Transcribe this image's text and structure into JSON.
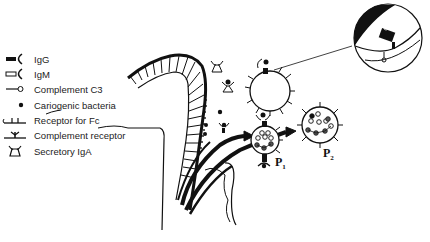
{
  "legend": {
    "items": [
      {
        "icon": "igg-icon",
        "label": "IgG"
      },
      {
        "icon": "igm-icon",
        "label": "IgM"
      },
      {
        "icon": "complement-c3-icon",
        "label": "Complement C3"
      },
      {
        "icon": "bacteria-dot-icon",
        "label": "Cariogenic bacteria"
      },
      {
        "icon": "fc-receptor-icon",
        "label": "Receptor for Fc"
      },
      {
        "icon": "complement-receptor-icon",
        "label": "Complement receptor"
      },
      {
        "icon": "secretory-iga-icon",
        "label": "Secretory IgA"
      }
    ]
  },
  "labels": {
    "p1": "P",
    "p1_sub": "1",
    "p2": "P",
    "p2_sub": "2"
  },
  "colors": {
    "ink": "#111111",
    "background": "#ffffff"
  }
}
